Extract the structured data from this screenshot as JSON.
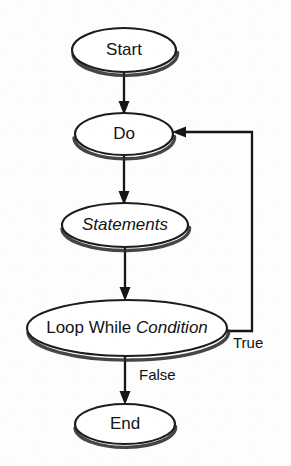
{
  "diagram": {
    "type": "flowchart",
    "background_color": "#fdfdfd",
    "line_color": "#161616",
    "shape_fill": "#ffffff",
    "shape_stroke": "#1c1c1c",
    "nodes": [
      {
        "id": "start",
        "label": "Start",
        "shape": "ellipse",
        "style": "regular",
        "font_size": 17,
        "cx": 124,
        "cy": 50,
        "rx": 52,
        "ry": 22
      },
      {
        "id": "do",
        "label": "Do",
        "shape": "ellipse",
        "style": "regular",
        "font_size": 17,
        "cx": 124,
        "cy": 134,
        "rx": 49,
        "ry": 21
      },
      {
        "id": "statements",
        "label": "Statements",
        "shape": "ellipse",
        "style": "italic",
        "font_size": 17,
        "cx": 125,
        "cy": 225,
        "rx": 63,
        "ry": 22
      },
      {
        "id": "loop-while-condition",
        "label_regular": "Loop While ",
        "label_italic": "Condition",
        "label": "Loop While Condition",
        "shape": "ellipse",
        "style": "mixed",
        "font_size": 17,
        "cx": 127,
        "cy": 328,
        "rx": 100,
        "ry": 28
      },
      {
        "id": "end",
        "label": "End",
        "shape": "ellipse",
        "style": "regular",
        "font_size": 17,
        "cx": 125,
        "cy": 424,
        "rx": 50,
        "ry": 20
      }
    ],
    "edges": [
      {
        "id": "start-to-do",
        "from": "start",
        "to": "do",
        "label": "",
        "arrow": true
      },
      {
        "id": "do-to-statements",
        "from": "do",
        "to": "statements",
        "label": "",
        "arrow": true
      },
      {
        "id": "statements-to-loop",
        "from": "statements",
        "to": "loop-while-condition",
        "label": "",
        "arrow": true
      },
      {
        "id": "loop-to-do-true",
        "from": "loop-while-condition",
        "to": "do",
        "label": "True",
        "label_x": 233,
        "label_y": 344,
        "arrow": true
      },
      {
        "id": "loop-to-end-false",
        "from": "loop-while-condition",
        "to": "end",
        "label": "False",
        "label_x": 139,
        "label_y": 376,
        "arrow": true
      }
    ]
  }
}
